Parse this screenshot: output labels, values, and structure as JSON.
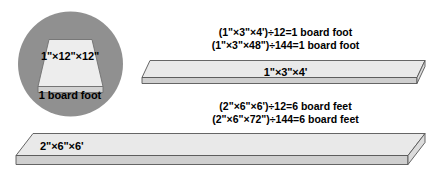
{
  "diagram": {
    "title_present": false,
    "inset": {
      "shape": "circle",
      "background_color": "#909090",
      "board_face_label": "1\"×12\"×12\"",
      "caption": "1 board foot",
      "board_top_color": "#ededed",
      "board_edge_color": "#d2d2d2"
    },
    "boards": [
      {
        "id": "board-1",
        "dimension_label": "1\"×3\"×4'",
        "equations": [
          "(1\"×3\"×4')÷12=1 board foot",
          "(1\"×3\"×48\")÷144=1 board foot"
        ],
        "top_color": "#e9e9e9",
        "edge_color": "#cfcfcf",
        "outline_color": "#565656"
      },
      {
        "id": "board-2",
        "dimension_label": "2\"×6\"×6'",
        "equations": [
          "(2\"×6\"×6')÷12=6 board feet",
          "(2\"×6\"×72\")÷144=6 board feet"
        ],
        "top_color": "#e9e9e9",
        "edge_color": "#cfcfcf",
        "outline_color": "#565656"
      }
    ],
    "colors": {
      "background": "#ffffff",
      "text": "#000000",
      "inset_gray": "#909090"
    }
  }
}
